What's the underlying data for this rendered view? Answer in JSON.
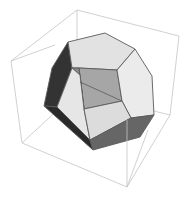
{
  "figure": {
    "title": "Polyhedron in bounding box",
    "object": "truncated polyhedron",
    "colors": {
      "background": "#ffffff",
      "box_edge": "#c4c4c4",
      "face_edge": "#5a5a5a",
      "light_face": "#e4e4e4",
      "lighter_face": "#ececec",
      "mid_face": "#a8a8a8",
      "dark_face": "#3a3a3a",
      "darker_face": "#2a2a2a",
      "bottom_face": "#6e6e6e"
    }
  }
}
